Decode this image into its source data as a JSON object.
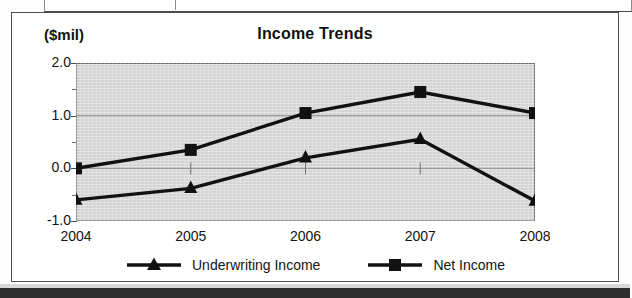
{
  "page": {
    "top_strip_label": "",
    "bottom_bar_label": ""
  },
  "chart": {
    "title": "Income Trends",
    "unit_label": "($mil)"
  },
  "chart_data": {
    "type": "line",
    "title": "Income Trends",
    "subtitle": "",
    "xlabel": "",
    "ylabel": "($mil)",
    "unit": "($mil)",
    "categories": [
      "2004",
      "2005",
      "2006",
      "2007",
      "2008"
    ],
    "x": [
      2004,
      2005,
      2006,
      2007,
      2008
    ],
    "ylim": [
      -1.0,
      2.0
    ],
    "yticks": [
      "-1.0",
      "0.0",
      "1.0",
      "2.0"
    ],
    "ytick_values": [
      -1.0,
      0.0,
      1.0,
      2.0
    ],
    "grid": true,
    "grid_axis": "y",
    "legend_position": "bottom",
    "plot_background": "#d4d4d4",
    "series": [
      {
        "name": "Underwriting Income",
        "marker": "triangle",
        "color": "#111111",
        "values": [
          -0.6,
          -0.38,
          0.2,
          0.55,
          -0.62
        ]
      },
      {
        "name": "Net Income",
        "marker": "square",
        "color": "#111111",
        "values": [
          0.0,
          0.35,
          1.05,
          1.45,
          1.05
        ]
      }
    ]
  },
  "legend": {
    "items": [
      {
        "label": "Underwriting Income",
        "marker": "triangle-marker-icon"
      },
      {
        "label": "Net Income",
        "marker": "square-marker-icon"
      }
    ]
  }
}
